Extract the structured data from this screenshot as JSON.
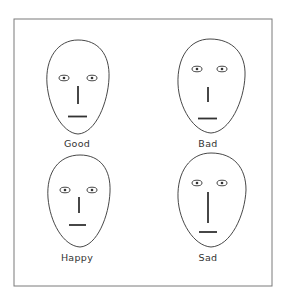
{
  "figure": {
    "frame_color": "#7a7a7a",
    "line_color": "#333333",
    "faces": [
      {
        "label": "Good"
      },
      {
        "label": "Bad"
      },
      {
        "label": "Happy"
      },
      {
        "label": "Sad"
      }
    ]
  }
}
